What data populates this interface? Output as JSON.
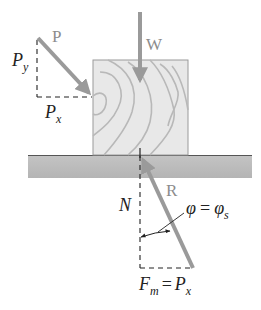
{
  "diagram": {
    "colors": {
      "background": "#ffffff",
      "block_fill": "#e6e6e6",
      "block_grain": "#b8b8b8",
      "ground_fill": "#bdbdbd",
      "ground_top_line": "#555555",
      "force_arrow": "#9a9a9a",
      "dashed_line": "#222222",
      "text": "#222222",
      "force_label": "#8c8c8c"
    },
    "forces": {
      "P": {
        "label": "P",
        "direction": "down-right, applied to left face of block"
      },
      "W": {
        "label": "W",
        "direction": "vertical downward through block center"
      },
      "R": {
        "label": "R",
        "direction": "up-left from below ground to contact point"
      }
    },
    "components": {
      "Py": {
        "symbol": "P",
        "subscript": "y"
      },
      "Px": {
        "symbol": "P",
        "subscript": "x"
      },
      "N": {
        "symbol": "N"
      },
      "Fm_eq": {
        "lhs_symbol": "F",
        "lhs_subscript": "m",
        "op": "=",
        "rhs_symbol": "P",
        "rhs_subscript": "x"
      },
      "phi_eq": {
        "lhs": "φ",
        "op": "=",
        "rhs_symbol": "φ",
        "rhs_subscript": "s"
      }
    }
  }
}
